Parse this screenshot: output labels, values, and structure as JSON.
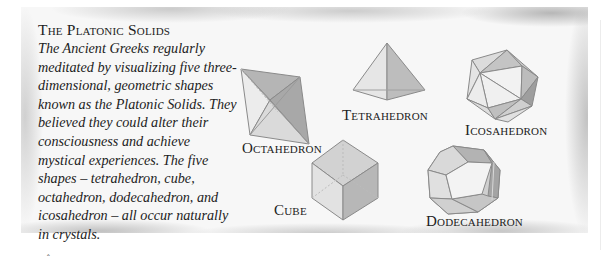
{
  "panel": {
    "title": "The Platonic Solids",
    "body": "The Ancient Greeks regularly meditated by visualizing five three-dimensional, geometric shapes known as the Platonic Solids. They believed they could alter their consciousness and achieve mystical experiences. The five shapes – tetrahedron, cube, octahedron, dodecahedron, and icosahedron – all occur naturally in crystals."
  },
  "solids": {
    "octahedron": "Octahedron",
    "tetrahedron": "Tetrahedron",
    "icosahedron": "Icosahedron",
    "cube": "Cube",
    "dodecahedron": "Dodecahedron"
  },
  "colors": {
    "panel_bg": "#f7f7f7",
    "face_light": "#e9e9e9",
    "face_mid": "#cfcfcf",
    "face_dark": "#a9a9a9",
    "edge": "#8a8a8a",
    "text": "#222222"
  }
}
